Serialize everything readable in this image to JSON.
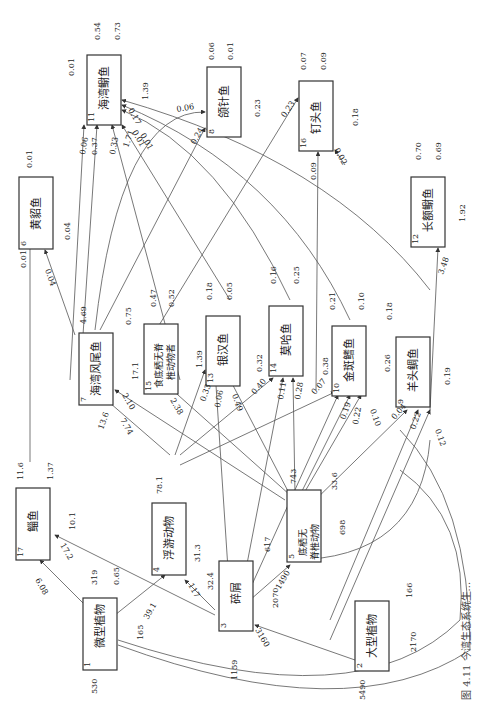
{
  "figure": {
    "caption": "图 4.11 今湾生态系统生...",
    "orientation": "rotated 90° clockwise (landscape figure on portrait page)"
  },
  "nodes": [
    {
      "id": 1,
      "name": "微型植物",
      "inflow": "530",
      "respiration": "165",
      "export": "0.65",
      "detritus": "319"
    },
    {
      "id": 2,
      "name": "大型植物",
      "inflow": "5490",
      "respiration": "2170",
      "export": "166"
    },
    {
      "id": 3,
      "name": "碎屑",
      "inflow": "1159",
      "respiration": "2070",
      "export": "617"
    },
    {
      "id": 4,
      "name": "浮游动物",
      "respiration": "31.3",
      "export": "32.4",
      "detritus": "78.1"
    },
    {
      "id": 5,
      "name": "底栖无脊椎动物",
      "respiration": "698",
      "export": "33.6",
      "detritus": "743"
    },
    {
      "id": 6,
      "name": "黄貂鱼",
      "respiration": "0.04",
      "detritus": "0.01"
    },
    {
      "id": 7,
      "name": "海湾风尾鱼",
      "respiration": "17.1",
      "export": "0.75",
      "detritus": "4.69"
    },
    {
      "id": 8,
      "name": "颌针鱼",
      "respiration": "0.23",
      "export": "0.01",
      "detritus": "0.06"
    },
    {
      "id": 9,
      "name": "羊头鲷鱼",
      "respiration": "0.19",
      "detritus": "0.18"
    },
    {
      "id": 10,
      "name": "金斑鳍鱼",
      "respiration": "0.26",
      "export": "0.10",
      "detritus": "0.21"
    },
    {
      "id": 11,
      "name": "海湾鳚鱼",
      "respiration": "1.39",
      "export": "0.73",
      "detritus": "0.54",
      "self_loop": "0.01"
    },
    {
      "id": 12,
      "name": "长额鳚鱼",
      "respiration": "1.92",
      "export": "0.69",
      "detritus": "0.70"
    },
    {
      "id": 13,
      "name": "银汉鱼",
      "respiration": "0.32",
      "export": "0.05",
      "detritus": "0.18"
    },
    {
      "id": 14,
      "name": "莫哈鱼",
      "respiration": "0.38",
      "export": "0.25",
      "detritus": "0.16"
    },
    {
      "id": 15,
      "name": "食底栖无脊椎动物者",
      "respiration": "1.39",
      "export": "0.52",
      "detritus": "0.47"
    },
    {
      "id": 16,
      "name": "钉头鱼",
      "respiration": "0.18",
      "export": "0.09",
      "detritus": "0.07"
    },
    {
      "id": 17,
      "name": "鲻鱼",
      "respiration": "10.1",
      "export": "1.37",
      "detritus": "11.6"
    }
  ],
  "flows": [
    {
      "from": 1,
      "to": 4,
      "value": "39.1"
    },
    {
      "from": 1,
      "to": 17,
      "value": "6.08"
    },
    {
      "from": 3,
      "to": 17,
      "value": "17.2"
    },
    {
      "from": 3,
      "to": 4,
      "value": "117"
    },
    {
      "from": 3,
      "to": 5,
      "value": "1490"
    },
    {
      "from": 2,
      "to": 3,
      "value": "3160"
    },
    {
      "from": 4,
      "to": 7,
      "value": "13.6"
    },
    {
      "from": 5,
      "to": 7,
      "value": "7.74"
    },
    {
      "from": 5,
      "to": 7,
      "value": "2.10"
    },
    {
      "from": 5,
      "to": 15,
      "value": "2.38"
    },
    {
      "from": 4,
      "to": 13,
      "value": "0.33"
    },
    {
      "from": 3,
      "to": 13,
      "value": "0.06"
    },
    {
      "from": 5,
      "to": 13,
      "value": "0.49"
    },
    {
      "from": 4,
      "to": 14,
      "value": "0.40"
    },
    {
      "from": 3,
      "to": 14,
      "value": "0.11"
    },
    {
      "from": 5,
      "to": 14,
      "value": "0.28"
    },
    {
      "from": 4,
      "to": 10,
      "value": "0.07"
    },
    {
      "from": 3,
      "to": 10,
      "value": "0.19"
    },
    {
      "from": 5,
      "to": 10,
      "value": "0.22"
    },
    {
      "from": 5,
      "to": 10,
      "value": "0.10"
    },
    {
      "from": 4,
      "to": 9,
      "value": "0.04"
    },
    {
      "from": 5,
      "to": 9,
      "value": "0.22"
    },
    {
      "from": 5,
      "to": 9,
      "value": "0.12"
    },
    {
      "from": 5,
      "to": 12,
      "value": "3.48"
    },
    {
      "from": 17,
      "to": 6,
      "value": "0.01"
    },
    {
      "from": 7,
      "to": 6,
      "value": "0.04"
    },
    {
      "from": 7,
      "to": 11,
      "value": "0.06"
    },
    {
      "from": 7,
      "to": 11,
      "value": "0.37"
    },
    {
      "from": 15,
      "to": 11,
      "value": "0.33"
    },
    {
      "from": 13,
      "to": 11,
      "value": "1.71"
    },
    {
      "from": 14,
      "to": 11,
      "value": "0.01"
    },
    {
      "from": 10,
      "to": 11,
      "value": "0.01"
    },
    {
      "from": 12,
      "to": 11,
      "value": "0.17"
    },
    {
      "from": 7,
      "to": 8,
      "value": "0.06"
    },
    {
      "from": 7,
      "to": 8,
      "value": "0.24"
    },
    {
      "from": 13,
      "to": 16,
      "value": "0.23"
    },
    {
      "from": 10,
      "to": 16,
      "value": "0.09"
    },
    {
      "from": 12,
      "to": 16,
      "value": "0.02"
    }
  ]
}
